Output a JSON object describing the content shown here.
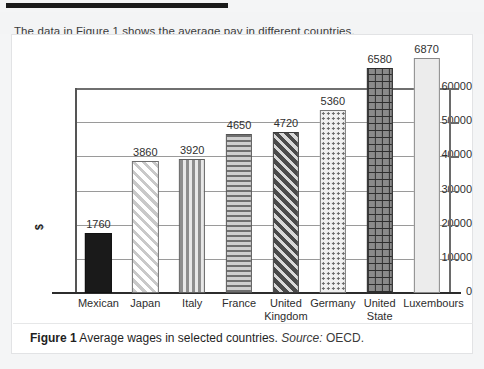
{
  "intro": {
    "text": "The data in Figure 1 shows the average pay in different countries."
  },
  "caption": {
    "figure_label": "Figure 1",
    "title": "Average wages in selected countries.",
    "source_label": "Source:",
    "source_value": "OECD."
  },
  "chart_data": {
    "type": "bar",
    "title": "",
    "xlabel": "",
    "ylabel": "$",
    "ylim": [
      0,
      60000
    ],
    "yticks": [
      "0",
      "10000",
      "20000",
      "30000",
      "40000",
      "50000",
      "60000"
    ],
    "grid": true,
    "legend": "none",
    "categories": [
      "Mexican",
      "Japan",
      "Italy",
      "France",
      "United Kingdom",
      "Germany",
      "United State",
      "Luxembours"
    ],
    "values": [
      17600,
      38600,
      39200,
      46500,
      47200,
      53600,
      65800,
      68700
    ],
    "data_labels": [
      "1760",
      "3860",
      "3920",
      "4650",
      "4720",
      "5360",
      "6580",
      "6870"
    ],
    "patterns": [
      "solid-black",
      "diagonal-hatch-light",
      "vertical-stripes",
      "horizontal-stripes",
      "diagonal-hatch-dark",
      "dots-light",
      "cross-grid-dark",
      "plain-light-gray"
    ],
    "colors": {
      "bar_outline": "#4a4a4a",
      "gridline": "#9a9a9a",
      "axis": "#2c2c2c",
      "text": "#2f2f2f"
    }
  }
}
